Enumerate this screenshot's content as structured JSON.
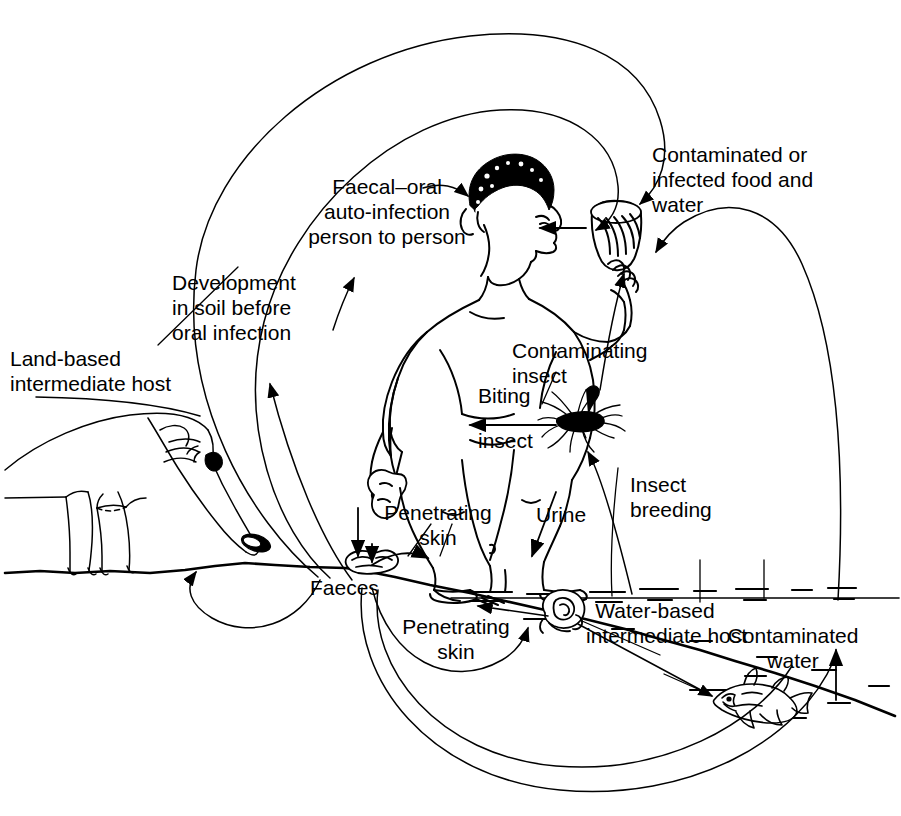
{
  "diagram": {
    "type": "transmission-cycle-diagram",
    "line_color": "#000000",
    "background": "#ffffff"
  },
  "labels": {
    "faecal_oral": "Faecal–oral\nauto-infection\nperson to person",
    "contaminated_food": "Contaminated or\ninfected food and\nwater",
    "development_soil": "Development\nin soil before\noral infection",
    "land_host": "Land-based\nintermediate host",
    "contaminating_insect": "Contaminating\ninsect",
    "biting_insect_top": "Biting",
    "biting_insect_bottom": "insect",
    "insect_breeding": "Insect\nbreeding",
    "urine": "Urine",
    "penetrating_skin_upper": "Penetrating\nskin",
    "penetrating_skin_lower": "Penetrating\nskin",
    "faeces": "Faeces",
    "water_host": "Water-based\nintermediate host",
    "contaminated_water": "Contaminated\nwater"
  },
  "figures": {
    "person": "standing-person-drinking-from-cup",
    "pig": "pig-land-intermediate-host",
    "mosquito": "mosquito-insect",
    "snail": "snail-water-intermediate-host",
    "fish": "fish-water-intermediate-host",
    "cup": "cup-of-water",
    "faeces_ground": "faeces-on-ground",
    "faeces_hand": "faeces-in-hand"
  },
  "arrows": [
    {
      "name": "faeces-to-mouth-outer-arc",
      "from": "faeces",
      "to": "cup",
      "style": "long-arc"
    },
    {
      "name": "faeces-to-mouth-inner-arc",
      "from": "faeces",
      "to": "mouth",
      "style": "long-arc"
    },
    {
      "name": "hand-to-mouth",
      "from": "faeces-hand",
      "to": "mouth",
      "style": "auto-infection"
    },
    {
      "name": "faecal-oral-label-pointer",
      "from": "label",
      "to": "head",
      "style": "pointer"
    },
    {
      "name": "faeces-to-soil-development",
      "from": "faeces",
      "to": "development-in-soil",
      "style": "curve"
    },
    {
      "name": "faeces-to-pig",
      "from": "faeces",
      "to": "pig-snout",
      "style": "loop"
    },
    {
      "name": "pig-to-land-host-label",
      "from": "pig",
      "to": "label",
      "style": "pointer"
    },
    {
      "name": "urine-to-water",
      "from": "person",
      "to": "water",
      "style": "straight"
    },
    {
      "name": "faeces-to-penetrating-skin-upper",
      "from": "faeces",
      "to": "foot",
      "style": "short-curve"
    },
    {
      "name": "hand-faeces-drop",
      "from": "hand",
      "to": "ground",
      "style": "straight-down"
    },
    {
      "name": "mosquito-biting-person",
      "from": "mosquito",
      "to": "person",
      "style": "straight-left"
    },
    {
      "name": "mosquito-to-cup-contaminating",
      "from": "mosquito",
      "to": "cup",
      "style": "straight-up"
    },
    {
      "name": "water-to-mosquito-breeding",
      "from": "water",
      "to": "mosquito",
      "style": "straight-up"
    },
    {
      "name": "snail-to-foot-penetrating",
      "from": "snail",
      "to": "foot",
      "style": "straight-left"
    },
    {
      "name": "faeces-to-snail",
      "from": "faeces",
      "to": "snail",
      "style": "arc"
    },
    {
      "name": "snail-to-fish",
      "from": "snail",
      "to": "fish",
      "style": "straight"
    },
    {
      "name": "fish-to-cup-contaminated-water",
      "from": "water",
      "to": "cup",
      "style": "long-arc-up"
    },
    {
      "name": "faeces-to-contaminated-water",
      "from": "faeces",
      "to": "water",
      "style": "bottom-arc"
    }
  ]
}
